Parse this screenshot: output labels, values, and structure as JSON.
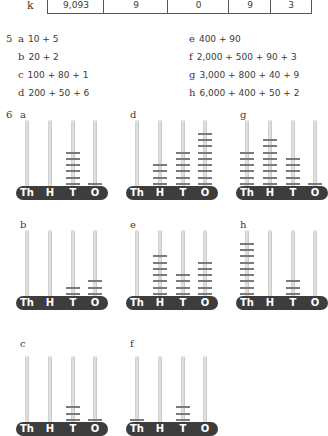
{
  "table_row": {
    "label": "k",
    "cells": [
      "9,093",
      "9",
      "0",
      "9",
      "3"
    ]
  },
  "exercise5": {
    "number": "5",
    "items": [
      {
        "letter": "a",
        "text": "10 + 5"
      },
      {
        "letter": "b",
        "text": "20 + 2"
      },
      {
        "letter": "c",
        "text": "100 + 80 + 1"
      },
      {
        "letter": "d",
        "text": "200 + 50 + 6"
      },
      {
        "letter": "e",
        "text": "400 + 90"
      },
      {
        "letter": "f",
        "text": "2,000 + 500 + 90 + 3"
      },
      {
        "letter": "g",
        "text": "3,000 + 800 + 40 + 9"
      },
      {
        "letter": "h",
        "text": "6,000 + 400 + 50 + 2"
      }
    ]
  },
  "exercise6": {
    "number": "6",
    "place_labels": [
      "Th",
      "H",
      "T",
      "O"
    ],
    "abaci": [
      {
        "letter": "a",
        "beads": [
          0,
          0,
          6,
          1
        ]
      },
      {
        "letter": "d",
        "beads": [
          0,
          4,
          6,
          9
        ]
      },
      {
        "letter": "g",
        "beads": [
          6,
          8,
          5,
          1
        ]
      },
      {
        "letter": "b",
        "beads": [
          0,
          0,
          2,
          3
        ]
      },
      {
        "letter": "e",
        "beads": [
          0,
          7,
          4,
          6
        ]
      },
      {
        "letter": "h",
        "beads": [
          9,
          0,
          3,
          0
        ]
      },
      {
        "letter": "c",
        "beads": [
          0,
          0,
          3,
          1
        ]
      },
      {
        "letter": "f",
        "beads": [
          1,
          0,
          3,
          0
        ]
      }
    ]
  }
}
